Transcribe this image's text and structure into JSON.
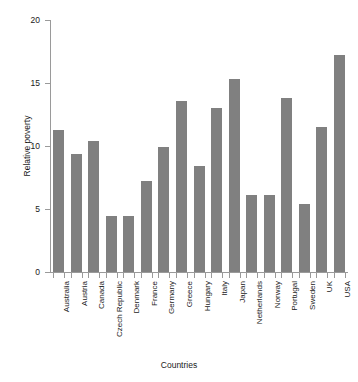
{
  "chart_data": {
    "type": "bar",
    "title": "",
    "xlabel": "Countries",
    "ylabel": "Relative poverty",
    "ylim": [
      0,
      20
    ],
    "yticks": [
      0,
      5,
      10,
      15,
      20
    ],
    "ytick_labels": [
      "0",
      "5",
      "10",
      "15",
      "20"
    ],
    "grid": false,
    "legend": null,
    "bar_color": "#808080",
    "axis_color": "#9a9a9a",
    "categories": [
      "Australia",
      "Austria",
      "Canada",
      "Czech Republic",
      "Denmark",
      "France",
      "Germany",
      "Greece",
      "Hungary",
      "Italy",
      "Japan",
      "Netherlands",
      "Norway",
      "Portugal",
      "Sweden",
      "UK",
      "USA"
    ],
    "values": [
      11.3,
      9.4,
      10.4,
      4.45,
      4.45,
      7.2,
      9.9,
      13.6,
      8.4,
      13.0,
      15.3,
      6.1,
      6.1,
      13.8,
      5.4,
      11.5,
      17.2
    ]
  }
}
